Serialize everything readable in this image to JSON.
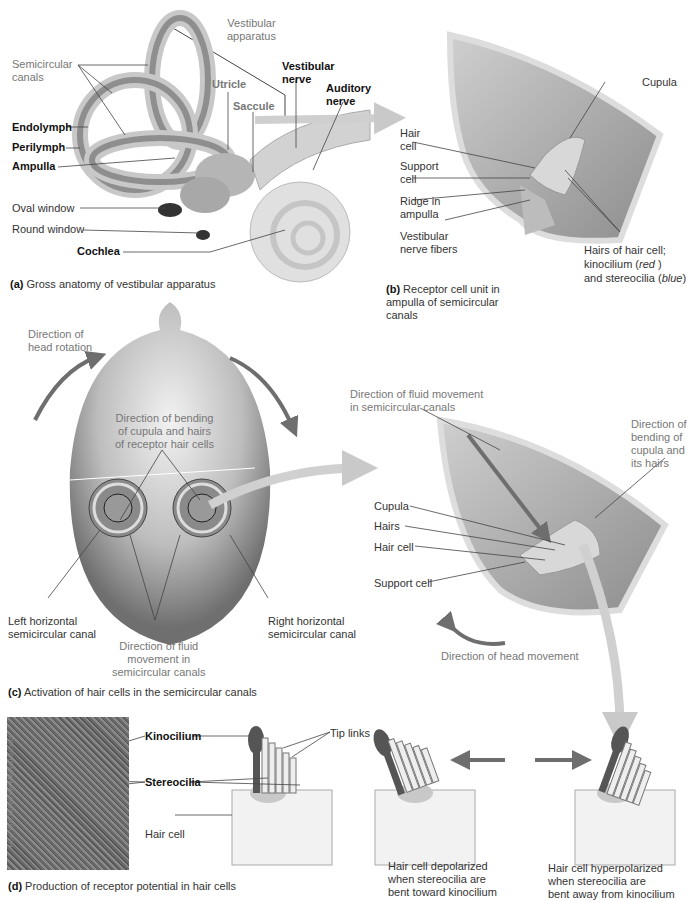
{
  "panels": {
    "a": {
      "caption_letter": "(a)",
      "caption_text": "Gross anatomy of vestibular apparatus",
      "labels": {
        "vestibular_apparatus": "Vestibular\napparatus",
        "semicircular_canals": "Semicircular\ncanals",
        "utricle": "Utricle",
        "saccule": "Saccule",
        "vestibular_nerve": "Vestibular\nnerve",
        "auditory_nerve": "Auditory\nnerve",
        "endolymph": "Endolymph",
        "perilymph": "Perilymph",
        "ampulla": "Ampulla",
        "oval_window": "Oval window",
        "round_window": "Round window",
        "cochlea": "Cochlea"
      }
    },
    "b": {
      "caption_letter": "(b)",
      "caption_text": "Receptor cell unit in\nampulla of semicircular\ncanals",
      "labels": {
        "cupula": "Cupula",
        "hair_cell": "Hair\ncell",
        "support_cell": "Support\ncell",
        "ridge": "Ridge in\nampulla",
        "nerve_fibers": "Vestibular\nnerve fibers",
        "hairs_line1": "Hairs of hair cell;",
        "hairs_line2_a": "kinocilium (",
        "hairs_line2_red": "red",
        "hairs_line2_b": " )",
        "hairs_line3_a": "and stereocilia (",
        "hairs_line3_blue": "blue",
        "hairs_line3_b": ")"
      }
    },
    "c": {
      "caption_letter": "(c)",
      "caption_text": "Activation of hair cells in the semicircular canals",
      "labels": {
        "head_rotation": "Direction of\nhead rotation",
        "bending_cupula": "Direction of bending\nof cupula and hairs\nof receptor hair cells",
        "left_canal": "Left horizontal\nsemicircular canal",
        "right_canal": "Right horizontal\nsemicircular canal",
        "fluid_movement": "Direction of fluid\nmovement in\nsemicircular canals",
        "fluid_movement_detail": "Direction of fluid movement\nin semicircular canals",
        "bending_detail": "Direction of\nbending of\ncupula and\nits hairs",
        "cupula": "Cupula",
        "hairs": "Hairs",
        "hair_cell": "Hair cell",
        "support_cell": "Support cell",
        "head_movement": "Direction of head movement"
      }
    },
    "d": {
      "caption_letter": "(d)",
      "caption_text": "Production of receptor potential in hair cells",
      "photo_credit": "New York University Medical School",
      "labels": {
        "kinocilium": "Kinocilium",
        "stereocilia": "Stereocilia",
        "hair_cell": "Hair cell",
        "tip_links": "Tip links",
        "depolarized": "Hair cell depolarized\nwhen stereocilia are\nbent toward kinocilium",
        "hyperpolarized": "Hair cell hyperpolarized\nwhen stereocilia are\nbent away from kinocilium"
      }
    }
  },
  "colors": {
    "arrow_dark": "#6e6e6e",
    "arrow_light": "#c9c9c9",
    "tissue": "#a9a9a9",
    "panel_bg": "#e4e4e4",
    "label_gray": "#777777"
  }
}
